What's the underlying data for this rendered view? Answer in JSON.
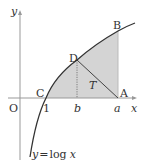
{
  "diagram": {
    "type": "function-graph",
    "curve_label": "y = log x",
    "curve_label_parts": {
      "y": "y",
      "eq": "=",
      "log": "log",
      "x": "x"
    },
    "axes": {
      "x_label": "x",
      "y_label": "y",
      "origin_label": "O"
    },
    "points": {
      "A": "A",
      "B": "B",
      "C": "C",
      "D": "D"
    },
    "ticks": {
      "one": "1",
      "b": "b",
      "a": "a"
    },
    "region_label": "T",
    "colors": {
      "shade": "#d4d4d4",
      "axis": "#888888",
      "curve": "#333333",
      "text": "#333333"
    }
  }
}
